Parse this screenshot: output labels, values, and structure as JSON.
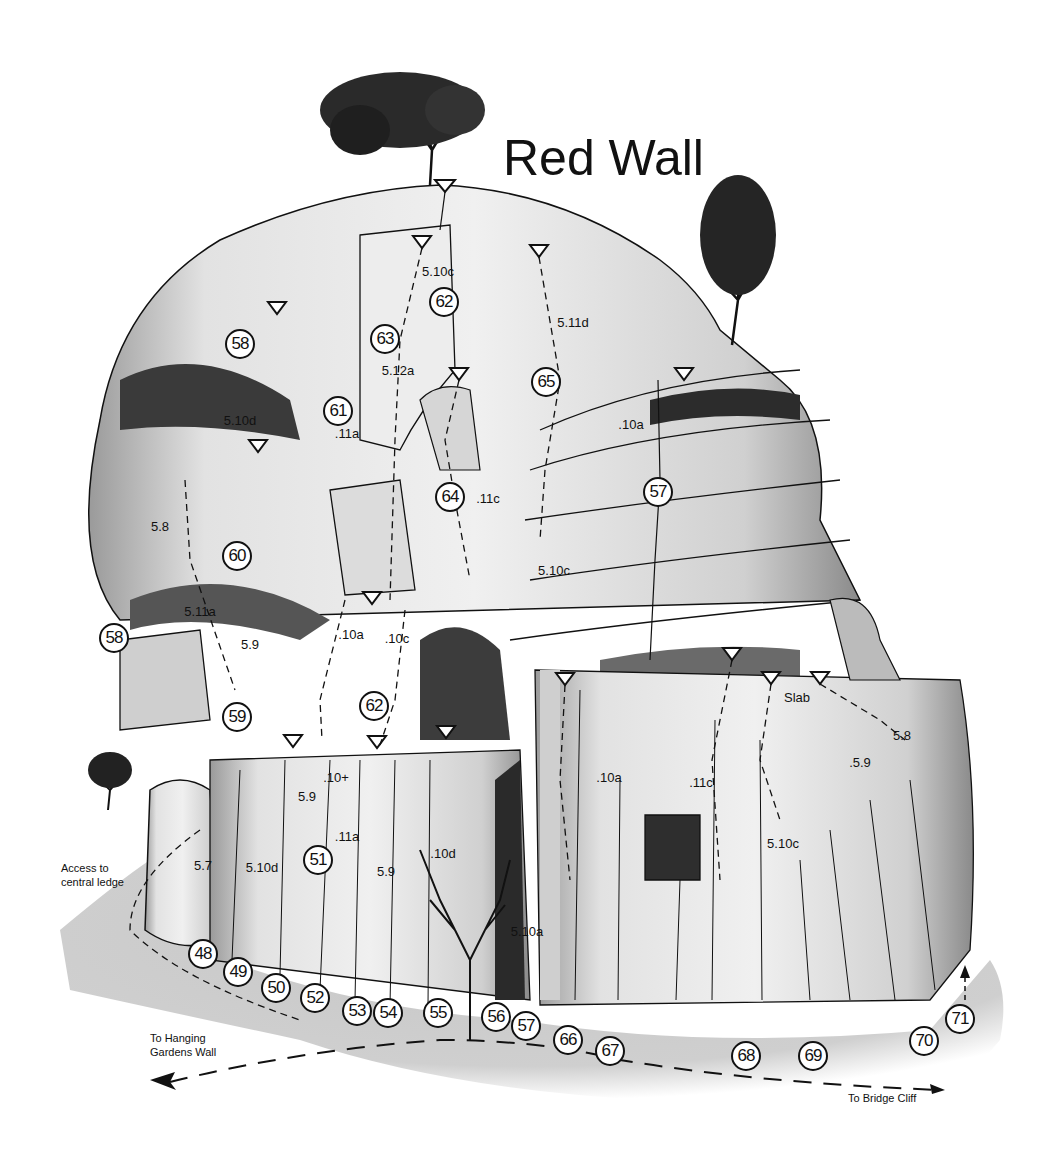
{
  "title": "Red Wall",
  "annotations": {
    "access": [
      "Access to",
      "central ledge"
    ],
    "hanging_gardens": [
      "To Hanging",
      "Gardens Wall"
    ],
    "bridge_cliff": "To Bridge Cliff",
    "slab": "Slab"
  },
  "routes": [
    {
      "n": "48",
      "x": 203,
      "y": 954
    },
    {
      "n": "49",
      "x": 238,
      "y": 972
    },
    {
      "n": "50",
      "x": 276,
      "y": 988
    },
    {
      "n": "51",
      "x": 318,
      "y": 860
    },
    {
      "n": "52",
      "x": 315,
      "y": 998
    },
    {
      "n": "53",
      "x": 357,
      "y": 1011
    },
    {
      "n": "54",
      "x": 388,
      "y": 1013
    },
    {
      "n": "55",
      "x": 438,
      "y": 1013
    },
    {
      "n": "56",
      "x": 496,
      "y": 1017
    },
    {
      "n": "57",
      "x": 526,
      "y": 1026
    },
    {
      "n": "57",
      "x": 658,
      "y": 492
    },
    {
      "n": "58",
      "x": 240,
      "y": 344
    },
    {
      "n": "58",
      "x": 114,
      "y": 638
    },
    {
      "n": "59",
      "x": 237,
      "y": 717
    },
    {
      "n": "60",
      "x": 237,
      "y": 556
    },
    {
      "n": "61",
      "x": 338,
      "y": 411
    },
    {
      "n": "62",
      "x": 444,
      "y": 302
    },
    {
      "n": "62",
      "x": 374,
      "y": 706
    },
    {
      "n": "63",
      "x": 385,
      "y": 339
    },
    {
      "n": "64",
      "x": 450,
      "y": 497
    },
    {
      "n": "65",
      "x": 546,
      "y": 382
    },
    {
      "n": "66",
      "x": 568,
      "y": 1040
    },
    {
      "n": "67",
      "x": 610,
      "y": 1051
    },
    {
      "n": "68",
      "x": 746,
      "y": 1056
    },
    {
      "n": "69",
      "x": 813,
      "y": 1056
    },
    {
      "n": "70",
      "x": 924,
      "y": 1041
    },
    {
      "n": "71",
      "x": 960,
      "y": 1019
    }
  ],
  "grades": [
    {
      "g": "5.10c",
      "x": 438,
      "y": 271
    },
    {
      "g": "5.12a",
      "x": 398,
      "y": 370
    },
    {
      "g": "5.11d",
      "x": 573,
      "y": 322
    },
    {
      "g": "5.10d",
      "x": 240,
      "y": 420
    },
    {
      "g": ".11a",
      "x": 347,
      "y": 433
    },
    {
      "g": ".10a",
      "x": 631,
      "y": 424
    },
    {
      "g": ".11c",
      "x": 488,
      "y": 498
    },
    {
      "g": "5.8",
      "x": 160,
      "y": 526
    },
    {
      "g": "5.10c",
      "x": 554,
      "y": 570
    },
    {
      "g": "5.11a",
      "x": 200,
      "y": 611
    },
    {
      "g": "5.9",
      "x": 250,
      "y": 644
    },
    {
      "g": ".10a",
      "x": 351,
      "y": 634
    },
    {
      "g": ".10c",
      "x": 397,
      "y": 638
    },
    {
      "g": "Slab",
      "x": 797,
      "y": 697
    },
    {
      "g": "5.8",
      "x": 902,
      "y": 735
    },
    {
      "g": ".5.9",
      "x": 860,
      "y": 762
    },
    {
      "g": ".10a",
      "x": 609,
      "y": 777
    },
    {
      "g": ".11c",
      "x": 701,
      "y": 782
    },
    {
      "g": "5.10c",
      "x": 783,
      "y": 843
    },
    {
      "g": ".10+",
      "x": 336,
      "y": 777
    },
    {
      "g": "5.9",
      "x": 307,
      "y": 796
    },
    {
      "g": ".11a",
      "x": 347,
      "y": 836
    },
    {
      "g": "5.7",
      "x": 203,
      "y": 865
    },
    {
      "g": "5.10d",
      "x": 262,
      "y": 867
    },
    {
      "g": "5.9",
      "x": 386,
      "y": 871
    },
    {
      "g": ".10d",
      "x": 443,
      "y": 853
    },
    {
      "g": "5.10a",
      "x": 527,
      "y": 931
    }
  ],
  "colors": {
    "ink": "#111111",
    "rock_light": "#e6e6e6",
    "rock_mid": "#bdbdbd",
    "rock_dark": "#5a5a5a",
    "ground": "#c8c8c8",
    "paper": "#ffffff"
  }
}
